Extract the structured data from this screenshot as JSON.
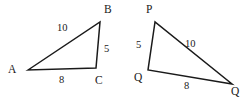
{
  "figure": {
    "stroke_color": "#1a1a1a",
    "text_color": "#1a1a1a",
    "background_color": "#ffffff",
    "stroke_width": 1.5
  },
  "triangles": [
    {
      "name": "triangle-abc",
      "vertices": [
        {
          "label": "A",
          "x": 28,
          "y": 70,
          "label_x": 8,
          "label_y": 64
        },
        {
          "label": "B",
          "x": 100,
          "y": 22,
          "label_x": 104,
          "label_y": 4
        },
        {
          "label": "C",
          "x": 96,
          "y": 68,
          "label_x": 95,
          "label_y": 75
        }
      ],
      "sides": [
        {
          "label": "10",
          "from": "A",
          "to": "B",
          "label_x": 57,
          "label_y": 23
        },
        {
          "label": "5",
          "from": "B",
          "to": "C",
          "label_x": 104,
          "label_y": 44
        },
        {
          "label": "8",
          "from": "A",
          "to": "C",
          "label_x": 59,
          "label_y": 75
        }
      ]
    },
    {
      "name": "triangle-pqr",
      "vertices": [
        {
          "label": "P",
          "x": 155,
          "y": 22,
          "label_x": 146,
          "label_y": 4
        },
        {
          "label": "Q",
          "x": 148,
          "y": 70,
          "label_x": 134,
          "label_y": 72
        },
        {
          "label": "Q",
          "x": 232,
          "y": 84,
          "label_x": 231,
          "label_y": 86
        }
      ],
      "sides": [
        {
          "label": "5",
          "from": "P",
          "to": "Q",
          "label_x": 136,
          "label_y": 40
        },
        {
          "label": "10",
          "from": "P",
          "to": "R",
          "label_x": 185,
          "label_y": 39
        },
        {
          "label": "8",
          "from": "Q",
          "to": "R",
          "label_x": 184,
          "label_y": 81
        }
      ]
    }
  ]
}
